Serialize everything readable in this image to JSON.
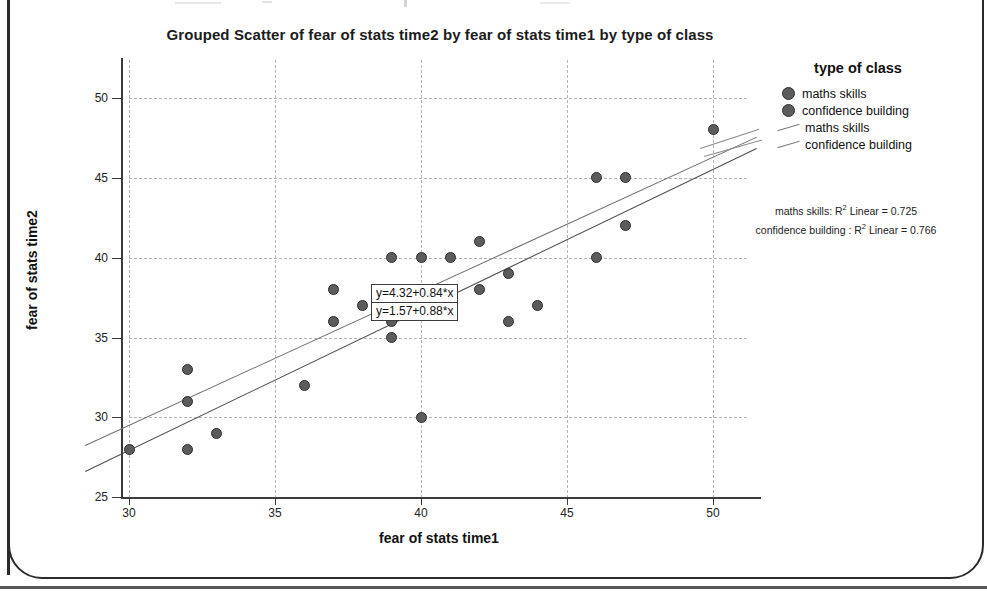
{
  "chart_data": {
    "type": "scatter",
    "title": "Grouped Scatter of fear of stats time2 by fear of stats time1 by type of class",
    "xlabel": "fear of stats time1",
    "ylabel": "fear of stats time2",
    "xlim": [
      28.5,
      51.5
    ],
    "ylim": [
      25,
      51
    ],
    "xticks": [
      30,
      35,
      40,
      45,
      50
    ],
    "yticks": [
      25,
      30,
      35,
      40,
      45,
      50
    ],
    "grid": true,
    "legend_position": "right",
    "legend_title": "type of class",
    "series": [
      {
        "name": "maths skills",
        "marker": "circle",
        "color": "#5c5c5c",
        "points": [
          [
            30,
            28
          ],
          [
            32,
            33
          ],
          [
            32,
            31
          ],
          [
            32,
            28
          ],
          [
            33,
            29
          ],
          [
            36,
            32
          ],
          [
            37,
            38
          ],
          [
            37,
            36
          ],
          [
            38,
            37
          ],
          [
            39,
            36
          ],
          [
            39,
            35
          ],
          [
            39,
            40
          ],
          [
            40,
            30
          ],
          [
            40,
            40
          ],
          [
            41,
            40
          ],
          [
            42,
            41
          ],
          [
            42,
            38
          ],
          [
            43,
            36
          ],
          [
            43,
            39
          ],
          [
            44,
            37
          ],
          [
            46,
            45
          ],
          [
            46,
            40
          ],
          [
            47,
            45
          ],
          [
            47,
            42
          ],
          [
            50,
            48
          ]
        ]
      },
      {
        "name": "confidence building",
        "marker": "circle",
        "color": "#5c5c5c",
        "points": []
      }
    ],
    "fit_lines": [
      {
        "name": "maths skills",
        "equation": "y=4.32+0.84*x",
        "intercept": 4.32,
        "slope": 0.84,
        "r2_label": "maths skills: R² Linear = 0.725",
        "r2": 0.725,
        "color": "#6f6f6f"
      },
      {
        "name": "confidence building",
        "equation": "y=1.57+0.88*x",
        "intercept": 1.57,
        "slope": 0.88,
        "r2_label": "confidence building : R² Linear = 0.766",
        "r2": 0.766,
        "color": "#4a4a4a"
      }
    ]
  },
  "legend": {
    "title": "type of class",
    "entries": [
      {
        "label": "maths skills",
        "kind": "marker"
      },
      {
        "label": "confidence building",
        "kind": "marker"
      },
      {
        "label": "maths skills",
        "kind": "line"
      },
      {
        "label": "confidence building",
        "kind": "line"
      }
    ]
  },
  "annotations": {
    "equation_top": "y=4.32+0.84*x",
    "equation_bottom": "y=1.57+0.88*x",
    "r2_maths_prefix": "maths skills: R",
    "r2_maths_suffix": " Linear = 0.725",
    "r2_conf_prefix": "confidence building : R",
    "r2_conf_suffix": " Linear = 0.766",
    "superscript": "2"
  },
  "axes": {
    "x_title": "fear of stats time1",
    "y_title": "fear of stats time2",
    "x_ticks": [
      "30",
      "35",
      "40",
      "45",
      "50"
    ],
    "y_ticks": [
      "50",
      "45",
      "40",
      "35",
      "30",
      "25"
    ]
  },
  "title": "Grouped Scatter of fear of stats time2 by fear of stats time1 by type of class"
}
